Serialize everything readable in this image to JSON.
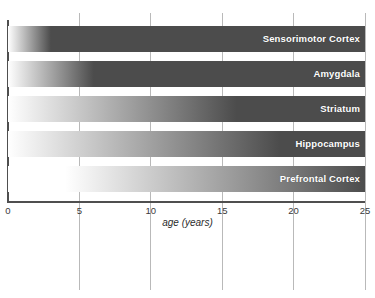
{
  "chart_data": {
    "type": "bar",
    "orientation": "horizontal",
    "title": "",
    "subtitle": "",
    "xlabel": "age (years)",
    "ylabel": "",
    "xlim": [
      0,
      25
    ],
    "xticks": [
      0,
      5,
      10,
      15,
      20,
      25
    ],
    "xtick_labels": [
      "0",
      "5",
      "10",
      "15",
      "20",
      "25"
    ],
    "grid": true,
    "grid_axis": "x",
    "legend": false,
    "legend_position": "none",
    "encoding": "Each bar spans the full 0-25 year axis; a white-to-dark-gray gradient encodes the degree of maturation, reaching full dark saturation at the region's maturation age.",
    "categories": [
      "Sensorimotor Cortex",
      "Amygdala",
      "Striatum",
      "Hippocampus",
      "Prefrontal Cortex"
    ],
    "values": [
      3,
      6,
      16,
      19,
      26
    ],
    "series": [
      {
        "name": "maturation age (years)",
        "values": [
          3,
          6,
          16,
          19,
          26
        ]
      }
    ],
    "bars": [
      {
        "label": "Sensorimotor Cortex",
        "maturation_age": 3,
        "gradient_start_age": 0,
        "gradient_end_age": 3,
        "bar_start_age": 0,
        "bar_end_age": 25
      },
      {
        "label": "Amygdala",
        "maturation_age": 6,
        "gradient_start_age": 0,
        "gradient_end_age": 6,
        "bar_start_age": 0,
        "bar_end_age": 25
      },
      {
        "label": "Striatum",
        "maturation_age": 16,
        "gradient_start_age": 0,
        "gradient_end_age": 16,
        "bar_start_age": 0,
        "bar_end_age": 25
      },
      {
        "label": "Hippocampus",
        "maturation_age": 19,
        "gradient_start_age": 0,
        "gradient_end_age": 19,
        "bar_start_age": 0,
        "bar_end_age": 25
      },
      {
        "label": "Prefrontal Cortex",
        "maturation_age": 26,
        "gradient_start_age": 4,
        "gradient_end_age": 26,
        "bar_start_age": 0,
        "bar_end_age": 25
      }
    ]
  },
  "colors": {
    "bar_dark": "#4c4c4c",
    "bar_light": "#ffffff",
    "gridline": "#b9b9b9",
    "axis": "#4f4f4f",
    "label_text": "#ffffff",
    "tick_text": "#3a3a3a",
    "background": "#ffffff"
  },
  "axis": {
    "title": "age (years)",
    "ticks": [
      {
        "value": 0,
        "label": "0"
      },
      {
        "value": 5,
        "label": "5"
      },
      {
        "value": 10,
        "label": "10"
      },
      {
        "value": 15,
        "label": "15"
      },
      {
        "value": 20,
        "label": "20"
      },
      {
        "value": 25,
        "label": "25"
      }
    ]
  }
}
